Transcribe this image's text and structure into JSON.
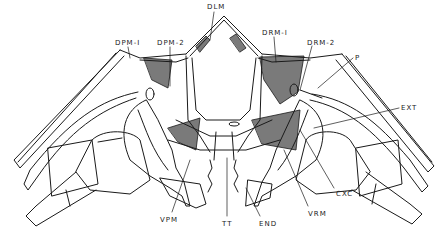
{
  "figure": {
    "colors": {
      "ink": "#1a1a1a",
      "muscle_shade": "#7a7a7a",
      "background": "#ffffff"
    },
    "labels": {
      "dlm": {
        "text": "DLM",
        "x": 207,
        "y": 3
      },
      "dpm1": {
        "text": "DPM-I",
        "x": 115,
        "y": 39
      },
      "dpm2": {
        "text": "DPM-2",
        "x": 157,
        "y": 39
      },
      "drm1": {
        "text": "DRM-I",
        "x": 262,
        "y": 29
      },
      "drm2": {
        "text": "DRM-2",
        "x": 307,
        "y": 39
      },
      "p": {
        "text": "P",
        "x": 355,
        "y": 54
      },
      "ext": {
        "text": "EXT",
        "x": 401,
        "y": 104
      },
      "cxc": {
        "text": "CXC",
        "x": 336,
        "y": 190
      },
      "vrm": {
        "text": "VRM",
        "x": 308,
        "y": 210
      },
      "vpm": {
        "text": "VPM",
        "x": 160,
        "y": 216
      },
      "tt": {
        "text": "TT",
        "x": 222,
        "y": 220
      },
      "end": {
        "text": "END",
        "x": 259,
        "y": 220
      }
    }
  }
}
